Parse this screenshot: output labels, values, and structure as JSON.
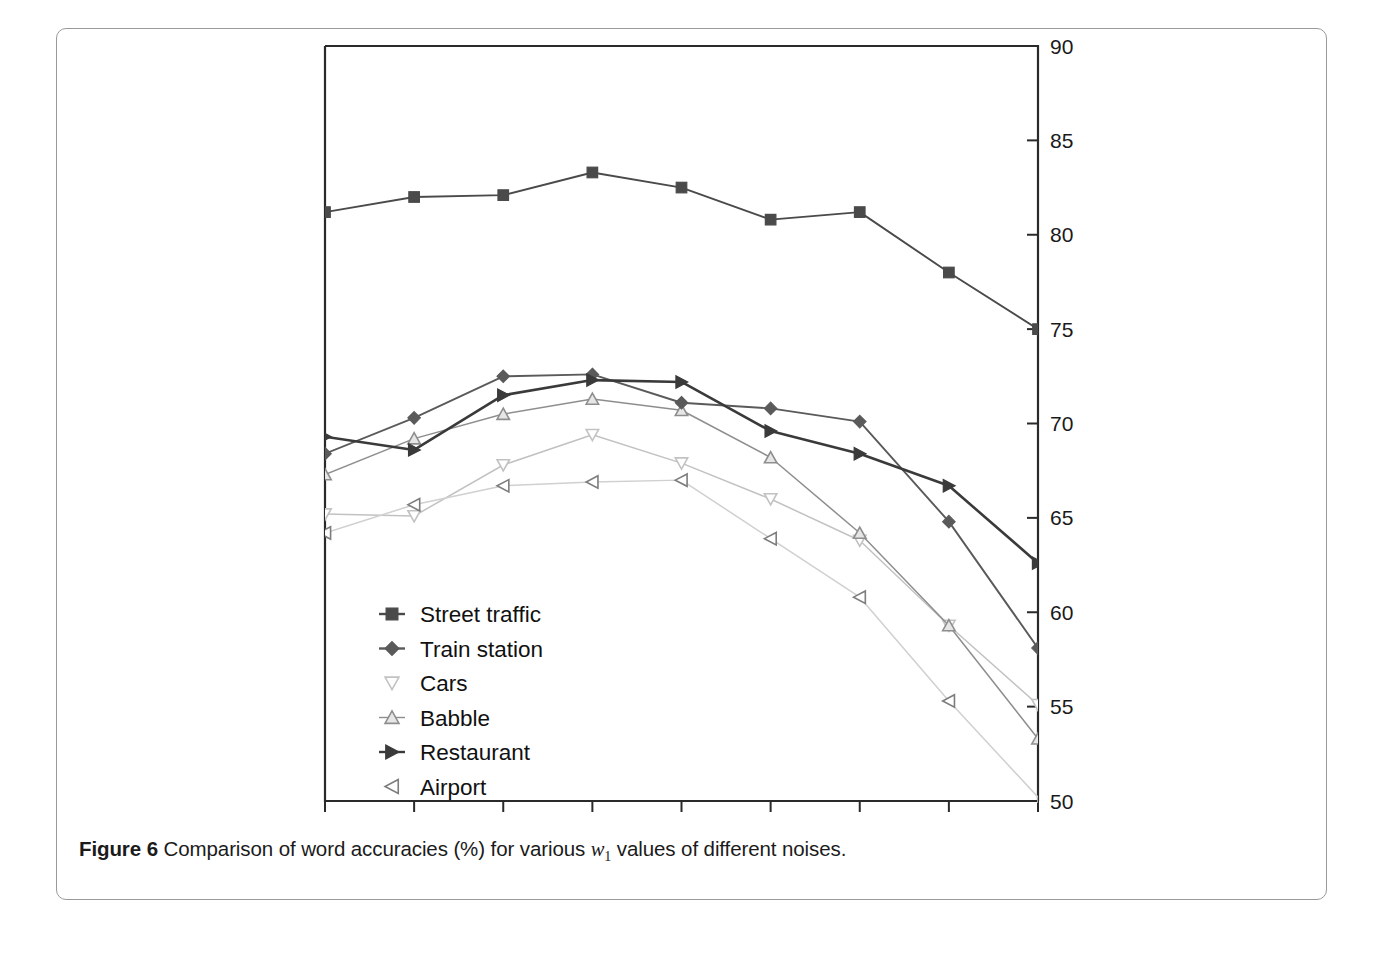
{
  "caption": {
    "label": "Figure 6",
    "text_before_var": "Comparison of word accuracies (%) for various ",
    "variable": "w",
    "variable_subscript": "1",
    "text_after_var": " values of different noises."
  },
  "chart_data": {
    "type": "line",
    "title": "",
    "xlabel": "",
    "ylabel": "",
    "x": [
      -9,
      -8,
      -7,
      -6,
      -5,
      -4,
      -3,
      -2,
      -1
    ],
    "xtick_labels": [
      "-9",
      "-8",
      "-7",
      "-6",
      "-5",
      "-4",
      "-3",
      "-2",
      "-1"
    ],
    "ytick_labels": [
      "50",
      "55",
      "60",
      "65",
      "70",
      "75",
      "80",
      "85",
      "90"
    ],
    "yticks": [
      50,
      55,
      60,
      65,
      70,
      75,
      80,
      85,
      90
    ],
    "xlim": [
      -9,
      -1
    ],
    "ylim": [
      50,
      90
    ],
    "grid": false,
    "legend_position": "inside-lower-left",
    "y_axis_side": "right",
    "series": [
      {
        "name": "Street traffic",
        "marker": "filled-square",
        "color": "#4a4a4a",
        "values": [
          81.2,
          82.0,
          82.1,
          83.3,
          82.5,
          80.8,
          81.2,
          78.0,
          75.0
        ]
      },
      {
        "name": "Train station",
        "marker": "filled-diamond",
        "color": "#5a5a5a",
        "values": [
          68.4,
          70.3,
          72.5,
          72.6,
          71.1,
          70.8,
          70.1,
          64.8,
          58.1
        ]
      },
      {
        "name": "Cars",
        "marker": "open-triangle-down",
        "color": "#c2c2c2",
        "values": [
          65.2,
          65.1,
          67.8,
          69.4,
          67.9,
          66.0,
          63.8,
          59.3,
          55.1
        ]
      },
      {
        "name": "Babble",
        "marker": "open-triangle-up",
        "color": "#8e8e8e",
        "values": [
          67.3,
          69.2,
          70.5,
          71.3,
          70.7,
          68.2,
          64.2,
          59.3,
          53.3
        ]
      },
      {
        "name": "Restaurant",
        "marker": "filled-triangle-right",
        "color": "#3a3a3a",
        "values": [
          69.3,
          68.6,
          71.5,
          72.3,
          72.2,
          69.6,
          68.4,
          66.7,
          62.6
        ]
      },
      {
        "name": "Airport",
        "marker": "open-triangle-left",
        "color": "#d0d0d0",
        "values": [
          64.2,
          65.7,
          66.7,
          66.9,
          67.0,
          63.9,
          60.8,
          55.3,
          50.2
        ]
      }
    ]
  }
}
